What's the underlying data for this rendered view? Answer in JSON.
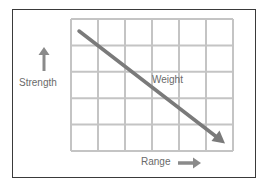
{
  "diagram": {
    "title": "",
    "grid": {
      "rows": 5,
      "columns": 6
    },
    "y_axis_label": "Strength",
    "x_axis_label": "Range",
    "trend_label": "Weight",
    "trend_direction": "decreasing",
    "icons": {
      "y_axis_arrow": "arrow-up-icon",
      "x_axis_arrow": "arrow-right-icon",
      "trend_arrow": "diagonal-arrow-down-right"
    },
    "colors": {
      "frame": "#3a3a3a",
      "grid": "#c4c4c4",
      "arrow": "#7a7a7a",
      "text": "#6a6a6a"
    }
  }
}
